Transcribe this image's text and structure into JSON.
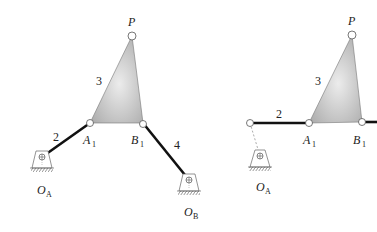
{
  "left_figure": {
    "labels": {
      "P": "P",
      "link_coupler": "3",
      "link_input": "2",
      "link_output": "4",
      "A1_main": "A",
      "A1_sub": "1",
      "B1_main": "B",
      "B1_sub": "1",
      "OA_main": "O",
      "OA_sub": "A",
      "OB_main": "O",
      "OB_sub": "B"
    }
  },
  "right_figure": {
    "labels": {
      "P": "P",
      "link_coupler": "3",
      "link_input": "2",
      "A1_main": "A",
      "A1_sub": "1",
      "B1_main": "B",
      "B1_sub": "1",
      "OA_main": "O",
      "OA_sub": "A"
    }
  },
  "colors": {
    "link": "#111111",
    "coupler_fill_dark": "#a9a9a9",
    "coupler_fill_light": "#ececec",
    "pin_stroke": "#555555",
    "ground_stroke": "#666666"
  }
}
